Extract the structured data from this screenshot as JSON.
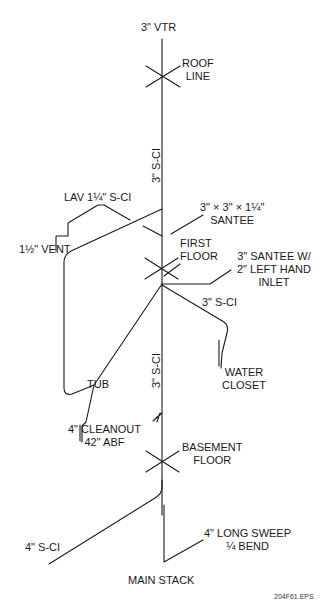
{
  "diagram": {
    "type": "plumbing DWV isometric riser",
    "labels": {
      "vtr": "3\" VTR",
      "roof_line_1": "ROOF",
      "roof_line_2": "LINE",
      "stack_upper": "3\" S-CI",
      "lav": "LAV 1¼\" S-CI",
      "santee_1": "3\" × 3\" × 1¼\"",
      "santee_2": "SANTEE",
      "vent": "1½\" VENT",
      "first_floor_1": "FIRST",
      "first_floor_2": "FLOOR",
      "santee_w_1": "3\" SANTEE W/",
      "santee_w_2": "2\" LEFT HAND",
      "santee_w_3": "INLET",
      "wc_branch": "3\" S-CI",
      "tub": "TUB",
      "stack_lower": "3\" S-CI",
      "water_closet_1": "WATER",
      "water_closet_2": "CLOSET",
      "cleanout_1": "4\" CLEANOUT",
      "cleanout_2": "42\" ABF",
      "basement_1": "BASEMENT",
      "basement_2": "FLOOR",
      "building_drain": "4\" S-CI",
      "sweep_1": "4\" LONG SWEEP",
      "sweep_2": "¼ BEND",
      "main_stack": "MAIN STACK",
      "file_id": "204F61.EPS"
    },
    "colors": {
      "line": "#1a1a1a",
      "background": "#ffffff"
    }
  }
}
